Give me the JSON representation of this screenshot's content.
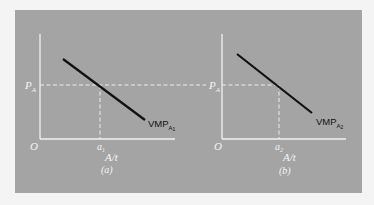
{
  "colors": {
    "page_background": "#f4f4f4",
    "panel_background": "#a4a4a4",
    "axis": "#f2f2f2",
    "curve": "#111111"
  },
  "panels": [
    {
      "id": "a",
      "caption": "(a)",
      "origin_label": "O",
      "y_label": "P",
      "y_label_sub": "A",
      "x_axis_label": "A/t",
      "x_mark_label": "a",
      "x_mark_sub": "1",
      "curve_label": "VMP",
      "curve_label_sub": "A",
      "curve_label_subsub": "1"
    },
    {
      "id": "b",
      "caption": "(b)",
      "origin_label": "O",
      "y_label": "P",
      "y_label_sub": "A",
      "x_axis_label": "A/t",
      "x_mark_label": "a",
      "x_mark_sub": "2",
      "curve_label": "VMP",
      "curve_label_sub": "A",
      "curve_label_subsub": "2"
    }
  ]
}
